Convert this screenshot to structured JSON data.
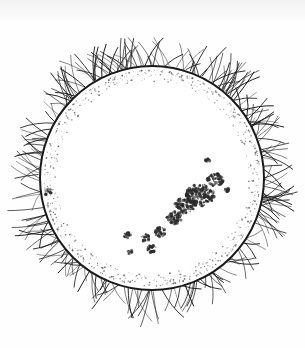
{
  "image": {
    "subject": "Engraving of the Sun showing a large sunspot group and solar prominences around the limb",
    "style": "black ink line illustration on white",
    "colors": {
      "background": "#fefefe",
      "ink": "#1a1a1a",
      "spot": "#2a2a2a",
      "faculae": "#555555"
    },
    "elements": {
      "sun_disk": "white solar disk with dark outline",
      "prominences": "flame-like curved tendrils around the whole circumference",
      "faculae": "stippled ring just inside the limb",
      "sunspot_group": "elongated cluster of dark spots running diagonally from lower-center to right of disk"
    }
  }
}
